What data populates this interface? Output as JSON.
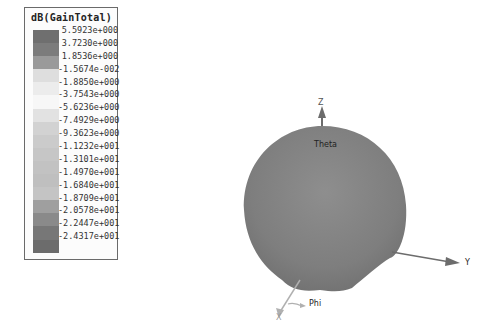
{
  "chart_data": {
    "type": "3d-radiation-pattern",
    "title": "dB(GainTotal)",
    "legend": {
      "title": "dB(GainTotal)",
      "labels": [
        "5.5923e+000",
        "3.7230e+000",
        "1.8536e+000",
        "-1.5674e-002",
        "-1.8850e+000",
        "-3.7543e+000",
        "-5.6236e+000",
        "-7.4929e+000",
        "-9.3623e+000",
        "-1.1232e+001",
        "-1.3101e+001",
        "-1.4970e+001",
        "-1.6840e+001",
        "-1.8709e+001",
        "-2.0578e+001",
        "-2.2447e+001",
        "-2.4317e+001"
      ],
      "values": [
        5.5923,
        3.723,
        1.8536,
        -0.015674,
        -1.885,
        -3.7543,
        -5.6236,
        -7.4929,
        -9.3623,
        -11.232,
        -13.101,
        -14.97,
        -16.84,
        -18.709,
        -20.578,
        -22.447,
        -24.317
      ],
      "colors": [
        "#6f6f6f",
        "#7c7c7c",
        "#9a9a9a",
        "#dedede",
        "#ececec",
        "#f7f7f7",
        "#e2e2e2",
        "#d2d2d2",
        "#cbcbcb",
        "#c6c6c6",
        "#c2c2c2",
        "#bfbfbf",
        "#c4c4c4",
        "#9f9f9f",
        "#8a8a8a",
        "#777777",
        "#6c6c6c"
      ]
    },
    "axes": {
      "z": "Z",
      "y": "Y",
      "x": "X",
      "theta": "Theta",
      "phi": "Phi"
    },
    "range_db": [
      -24.317,
      5.5923
    ]
  }
}
